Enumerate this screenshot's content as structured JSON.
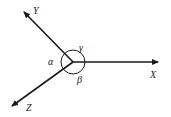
{
  "diagram": {
    "type": "coordinate-axes",
    "origin": [
      73,
      62
    ],
    "axes": [
      {
        "name": "X",
        "label": "X",
        "tip": [
          158,
          62
        ]
      },
      {
        "name": "Y",
        "label": "Y",
        "tip": [
          22,
          10
        ]
      },
      {
        "name": "Z",
        "label": "Z",
        "tip": [
          10,
          108
        ]
      }
    ],
    "angles": [
      {
        "name": "alpha",
        "label": "α"
      },
      {
        "name": "beta",
        "label": "β"
      },
      {
        "name": "gamma",
        "label": "γ"
      }
    ],
    "colors": {
      "stroke": "#1a1a1a",
      "background": "#ffffff"
    }
  }
}
